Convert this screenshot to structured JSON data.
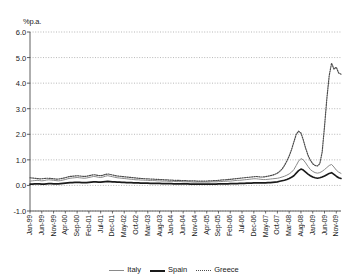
{
  "chart_data": {
    "type": "line",
    "title": "",
    "subtitle": "",
    "unit_label": "%p.a.",
    "ylabel": "%p.a.",
    "xlabel": "",
    "ylim": [
      -1.0,
      6.0
    ],
    "ytick_step": 1.0,
    "yticks": [
      "6.0",
      "5.0",
      "4.0",
      "3.0",
      "2.0",
      "1.0",
      "0.0",
      "-1.0"
    ],
    "ytick_values": [
      6.0,
      5.0,
      4.0,
      3.0,
      2.0,
      1.0,
      0.0,
      -1.0
    ],
    "grid": true,
    "grid_axis": "y",
    "legend_position": "bottom",
    "x_tick_step_months": 5,
    "xtick_labels": [
      "Jan-99",
      "Jun-99",
      "Nov-99",
      "Apr-00",
      "Sep-00",
      "Feb-01",
      "Jul-01",
      "Dec-01",
      "May-02",
      "Oct-02",
      "Mar-03",
      "Aug-03",
      "Jan-04",
      "Jun-04",
      "Nov-04",
      "Apr-05",
      "Sep-05",
      "Feb-06",
      "Jul-06",
      "Dec-06",
      "May-07",
      "Oct-07",
      "Mar-08",
      "Aug-08",
      "Jan-09",
      "Jun-09",
      "Nov-09"
    ],
    "x_start": "Jan-99",
    "x_end": "Nov-09",
    "series": [
      {
        "name": "Italy",
        "color": "#8a8a8a",
        "style": "solid",
        "width": 1,
        "values": [
          0.17,
          0.18,
          0.19,
          0.2,
          0.19,
          0.18,
          0.19,
          0.21,
          0.22,
          0.21,
          0.2,
          0.19,
          0.18,
          0.19,
          0.21,
          0.23,
          0.26,
          0.28,
          0.29,
          0.3,
          0.31,
          0.3,
          0.29,
          0.28,
          0.29,
          0.31,
          0.33,
          0.35,
          0.34,
          0.32,
          0.31,
          0.33,
          0.36,
          0.38,
          0.36,
          0.34,
          0.32,
          0.3,
          0.29,
          0.28,
          0.27,
          0.26,
          0.25,
          0.24,
          0.23,
          0.22,
          0.22,
          0.21,
          0.21,
          0.2,
          0.2,
          0.19,
          0.19,
          0.19,
          0.18,
          0.18,
          0.17,
          0.17,
          0.17,
          0.16,
          0.16,
          0.16,
          0.15,
          0.15,
          0.15,
          0.14,
          0.14,
          0.14,
          0.14,
          0.13,
          0.13,
          0.13,
          0.13,
          0.13,
          0.13,
          0.13,
          0.13,
          0.14,
          0.14,
          0.14,
          0.15,
          0.15,
          0.16,
          0.16,
          0.17,
          0.17,
          0.18,
          0.19,
          0.2,
          0.2,
          0.21,
          0.22,
          0.23,
          0.24,
          0.25,
          0.26,
          0.26,
          0.25,
          0.24,
          0.23,
          0.23,
          0.24,
          0.25,
          0.26,
          0.27,
          0.28,
          0.3,
          0.33,
          0.36,
          0.4,
          0.45,
          0.52,
          0.62,
          0.78,
          0.95,
          1.05,
          1.0,
          0.88,
          0.74,
          0.62,
          0.55,
          0.5,
          0.48,
          0.5,
          0.55,
          0.62,
          0.7,
          0.78,
          0.82,
          0.72,
          0.6,
          0.52,
          0.47
        ]
      },
      {
        "name": "Spain",
        "color": "#1a1a1a",
        "style": "solid",
        "width": 1.6,
        "values": [
          0.05,
          0.05,
          0.06,
          0.06,
          0.06,
          0.05,
          0.05,
          0.06,
          0.07,
          0.07,
          0.06,
          0.06,
          0.06,
          0.07,
          0.08,
          0.09,
          0.1,
          0.11,
          0.11,
          0.12,
          0.12,
          0.12,
          0.11,
          0.11,
          0.11,
          0.12,
          0.13,
          0.14,
          0.14,
          0.13,
          0.13,
          0.14,
          0.15,
          0.16,
          0.15,
          0.14,
          0.14,
          0.13,
          0.13,
          0.12,
          0.12,
          0.11,
          0.11,
          0.11,
          0.1,
          0.1,
          0.1,
          0.09,
          0.09,
          0.09,
          0.09,
          0.08,
          0.08,
          0.08,
          0.08,
          0.08,
          0.07,
          0.07,
          0.07,
          0.07,
          0.07,
          0.06,
          0.06,
          0.06,
          0.06,
          0.06,
          0.06,
          0.06,
          0.05,
          0.05,
          0.05,
          0.05,
          0.05,
          0.05,
          0.05,
          0.05,
          0.05,
          0.05,
          0.05,
          0.05,
          0.06,
          0.06,
          0.06,
          0.06,
          0.06,
          0.07,
          0.07,
          0.07,
          0.07,
          0.08,
          0.08,
          0.08,
          0.09,
          0.09,
          0.09,
          0.1,
          0.1,
          0.1,
          0.1,
          0.1,
          0.1,
          0.11,
          0.11,
          0.12,
          0.13,
          0.14,
          0.16,
          0.18,
          0.2,
          0.23,
          0.27,
          0.32,
          0.38,
          0.48,
          0.58,
          0.64,
          0.6,
          0.52,
          0.44,
          0.38,
          0.33,
          0.3,
          0.28,
          0.3,
          0.33,
          0.37,
          0.42,
          0.47,
          0.5,
          0.43,
          0.36,
          0.3,
          0.27
        ]
      },
      {
        "name": "Greece",
        "color": "#4d4d4d",
        "style": "dotted",
        "width": 1.2,
        "values": [
          0.3,
          0.29,
          0.28,
          0.27,
          0.26,
          0.26,
          0.27,
          0.28,
          0.28,
          0.27,
          0.26,
          0.25,
          0.25,
          0.26,
          0.28,
          0.3,
          0.33,
          0.35,
          0.36,
          0.37,
          0.38,
          0.37,
          0.36,
          0.35,
          0.36,
          0.38,
          0.4,
          0.42,
          0.41,
          0.39,
          0.38,
          0.4,
          0.43,
          0.45,
          0.43,
          0.41,
          0.39,
          0.37,
          0.36,
          0.35,
          0.34,
          0.33,
          0.32,
          0.31,
          0.3,
          0.29,
          0.28,
          0.27,
          0.27,
          0.26,
          0.26,
          0.25,
          0.25,
          0.24,
          0.24,
          0.23,
          0.23,
          0.22,
          0.22,
          0.21,
          0.21,
          0.2,
          0.2,
          0.2,
          0.19,
          0.19,
          0.19,
          0.18,
          0.18,
          0.18,
          0.18,
          0.17,
          0.17,
          0.17,
          0.17,
          0.17,
          0.18,
          0.18,
          0.19,
          0.19,
          0.2,
          0.21,
          0.22,
          0.22,
          0.23,
          0.24,
          0.25,
          0.26,
          0.27,
          0.28,
          0.29,
          0.3,
          0.31,
          0.32,
          0.33,
          0.34,
          0.35,
          0.34,
          0.33,
          0.33,
          0.34,
          0.36,
          0.38,
          0.4,
          0.44,
          0.48,
          0.55,
          0.64,
          0.78,
          0.95,
          1.15,
          1.4,
          1.7,
          2.0,
          2.12,
          2.05,
          1.78,
          1.45,
          1.18,
          0.98,
          0.85,
          0.78,
          0.76,
          0.85,
          1.3,
          2.3,
          3.4,
          4.3,
          4.78,
          4.55,
          4.62,
          4.4,
          4.35
        ]
      }
    ],
    "annotations": []
  },
  "legend": {
    "items": [
      {
        "label": "Italy"
      },
      {
        "label": "Spain"
      },
      {
        "label": "Greece"
      }
    ]
  }
}
